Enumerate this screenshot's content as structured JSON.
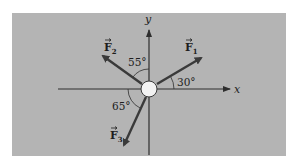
{
  "figure": {
    "background_color": "#b4b4b4",
    "panel": {
      "x": 12,
      "y": 13,
      "width": 274,
      "height": 143
    },
    "origin": {
      "x": 149,
      "y": 89
    },
    "particle": {
      "radius": 8,
      "fill": "#f2f2f2",
      "stroke": "#3a3a3a"
    },
    "axes": {
      "x_label": "x",
      "y_label": "y",
      "color": "#2e2e2e"
    },
    "forces": [
      {
        "name": "F1",
        "label": "F",
        "subscript": "1",
        "angle_deg": 30,
        "angle_reference": "from +x axis",
        "angle_label": "30°"
      },
      {
        "name": "F2",
        "label": "F",
        "subscript": "2",
        "angle_deg": 55,
        "angle_reference": "from +y axis toward -x",
        "angle_label": "55°"
      },
      {
        "name": "F3",
        "label": "F",
        "subscript": "3",
        "angle_deg": 65,
        "angle_reference": "from -x axis toward -y",
        "angle_label": "65°"
      }
    ],
    "arrow_color": "#3a3a3a",
    "text_color": "#1e1e1e"
  }
}
